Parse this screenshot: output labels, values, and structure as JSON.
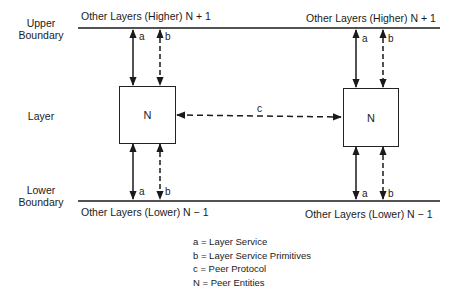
{
  "left_labels": {
    "upper_boundary": [
      "Upper",
      "Boundary"
    ],
    "layer": "Layer",
    "lower_boundary": [
      "Lower",
      "Boundary"
    ]
  },
  "boundaries": {
    "upper_left": "Other Layers (Higher) N + 1",
    "upper_right": "Other Layers (Higher) N + 1",
    "lower_left": "Other Layers (Lower) N − 1",
    "lower_right": "Other Layers (Lower) N − 1"
  },
  "entities": {
    "left": "N",
    "right": "N"
  },
  "arrow_labels": {
    "a": "a",
    "b": "b",
    "c": "c"
  },
  "legend": [
    "a  =  Layer Service",
    "b  =  Layer Service Primitives",
    "c  =  Peer Protocol",
    "N  =  Peer Entities"
  ],
  "colors": {
    "line": "#1a1a1a",
    "background": "#ffffff"
  }
}
